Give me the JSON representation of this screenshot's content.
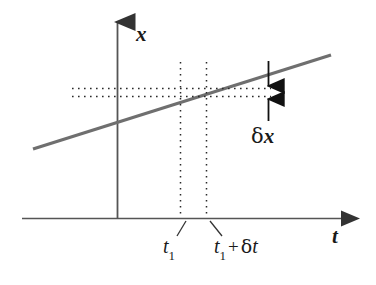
{
  "figure": {
    "type": "line-diagram",
    "background_color": "#ffffff",
    "axes": {
      "vertical": {
        "name": "x-axis",
        "label": "x",
        "label_style": "italic",
        "color": "#555555",
        "x": 117,
        "y_top": 12,
        "y_bottom": 218,
        "arrow": "up"
      },
      "horizontal": {
        "name": "t-axis",
        "label": "t",
        "label_style": "italic",
        "color": "#555555",
        "y": 218,
        "x_left": 22,
        "x_right": 352,
        "arrow": "right"
      }
    },
    "data_line": {
      "name": "x-of-t-line",
      "color": "#6f6f6f",
      "width": 3,
      "x1": 33,
      "y1": 149,
      "x2": 331,
      "y2": 55,
      "description": "straight sloped line representing x(t)"
    },
    "guides": {
      "color": "#2a2a2a",
      "style": "dotted",
      "vertical": [
        {
          "name": "guide-t1",
          "x": 180,
          "y_top": 62,
          "y_bottom": 218
        },
        {
          "name": "guide-t1-plus-dt",
          "x": 206,
          "y_top": 62,
          "y_bottom": 218
        }
      ],
      "horizontal": [
        {
          "name": "guide-x1",
          "y": 88,
          "x_left": 72,
          "x_right": 271
        },
        {
          "name": "guide-x1-plus-dx",
          "y": 96,
          "x_left": 72,
          "x_right": 271
        }
      ]
    },
    "annotation": {
      "name": "delta-x-annotation",
      "label_prefix": "δ",
      "label_variable": "x",
      "label_full": "δx",
      "arrow_x": 268,
      "arrow_down": {
        "y_start": 61,
        "y_end": 89
      },
      "arrow_up": {
        "y_start": 121,
        "y_end": 95
      },
      "text_x": 251,
      "text_y": 126,
      "color": "#111111"
    },
    "tick_labels": [
      {
        "name": "tick-label-t1",
        "base": "t",
        "subscript": "1",
        "suffix": "",
        "delta": "",
        "leader": {
          "x1": 185,
          "y1": 222,
          "x2": 176,
          "y2": 236
        },
        "text_x": 163,
        "text_y": 236
      },
      {
        "name": "tick-label-t1-plus-delta-t",
        "base": "t",
        "subscript": "1",
        "operator": "+",
        "delta_prefix": "δ",
        "delta_variable": "t",
        "leader": {
          "x1": 210,
          "y1": 222,
          "x2": 223,
          "y2": 236
        },
        "text_x": 213,
        "text_y": 236
      }
    ]
  }
}
